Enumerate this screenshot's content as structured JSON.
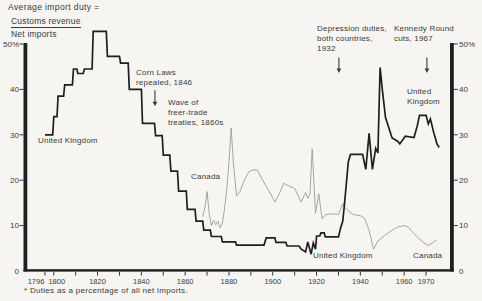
{
  "header": {
    "title": "Average import duty =",
    "numerator": "Customs revenue",
    "denominator": "Net imports"
  },
  "annotations": {
    "corn_laws": {
      "text": "Corn Laws\nrepealed, 1846"
    },
    "wave": {
      "text": "Wave of\nfreer-trade\ntreaties, 1860s"
    },
    "depression": {
      "text": "Depression duties,\nboth countries,\n1932"
    },
    "kennedy": {
      "text": "Kennedy Round\ncuts, 1967"
    }
  },
  "series_labels": {
    "uk_left": "United Kingdom",
    "uk_right": "United\nKingdom",
    "uk_bottom": "United Kingdom",
    "canada_upper": "Canada",
    "canada_lower": "Canada"
  },
  "footnote": "* Duties as a percentage of all net imports.",
  "colors": {
    "uk_line": "#1f1f1f",
    "canada_line": "#9c9c9c",
    "axis": "#1f1f1f",
    "text": "#3a3a3a"
  },
  "chart_data": {
    "type": "line",
    "xlabel": "",
    "ylabel": "Average import duty, %",
    "xlim": [
      1787,
      1982
    ],
    "ylim": [
      0,
      50
    ],
    "grid": false,
    "y_axis": {
      "labels": [
        {
          "value": 50,
          "text": "50%"
        },
        {
          "value": 40,
          "text": "40"
        },
        {
          "value": 30,
          "text": "30"
        },
        {
          "value": 20,
          "text": "20"
        },
        {
          "value": 10,
          "text": "10"
        },
        {
          "value": 0,
          "text": "0"
        }
      ]
    },
    "x_axis": {
      "tick_years": [
        1796,
        1800,
        1810,
        1820,
        1830,
        1840,
        1850,
        1860,
        1870,
        1880,
        1890,
        1900,
        1910,
        1920,
        1930,
        1940,
        1950,
        1960,
        1970
      ],
      "labels": [
        {
          "year": 1796,
          "text": "1796",
          "dx": -9
        },
        {
          "year": 1800,
          "text": "1800",
          "dx": 3
        },
        {
          "year": 1820,
          "text": "1820",
          "dx": 0
        },
        {
          "year": 1840,
          "text": "1840",
          "dx": 0
        },
        {
          "year": 1860,
          "text": "1860",
          "dx": 0
        },
        {
          "year": 1880,
          "text": "1880",
          "dx": 0
        },
        {
          "year": 1900,
          "text": "1900",
          "dx": 0
        },
        {
          "year": 1920,
          "text": "1920",
          "dx": 0
        },
        {
          "year": 1940,
          "text": "1940",
          "dx": 0
        },
        {
          "year": 1960,
          "text": "1960",
          "dx": 0
        },
        {
          "year": 1970,
          "text": "1970",
          "dx": 0
        }
      ]
    },
    "annotation_arrows": [
      {
        "name": "corn-laws-arrow",
        "year": 1846.2,
        "value_from": 39.8,
        "value_to": 36.3
      },
      {
        "name": "depression-arrow",
        "year": 1930.2,
        "value_from": 47.0,
        "value_to": 43.6
      },
      {
        "name": "kennedy-arrow",
        "year": 1970.4,
        "value_from": 47.0,
        "value_to": 43.6
      }
    ],
    "series": [
      {
        "id": "uk",
        "name": "United Kingdom",
        "color": "#1f1f1f",
        "width": 1.7,
        "points": [
          [
            1796,
            30
          ],
          [
            1799.5,
            30
          ],
          [
            1800,
            34
          ],
          [
            1801.5,
            34
          ],
          [
            1802,
            38.5
          ],
          [
            1804.5,
            38.5
          ],
          [
            1805,
            41
          ],
          [
            1808.5,
            41
          ],
          [
            1809,
            44.5
          ],
          [
            1810.5,
            44.5
          ],
          [
            1811,
            43.5
          ],
          [
            1813.5,
            43.5
          ],
          [
            1814,
            44.5
          ],
          [
            1817.5,
            44.5
          ],
          [
            1818,
            52.8
          ],
          [
            1824,
            52.8
          ],
          [
            1824.5,
            47.3
          ],
          [
            1830,
            47.3
          ],
          [
            1830.5,
            45.8
          ],
          [
            1834,
            45.8
          ],
          [
            1834.5,
            40
          ],
          [
            1840,
            40
          ],
          [
            1840.5,
            32.5
          ],
          [
            1846,
            32.5
          ],
          [
            1846.5,
            29.8
          ],
          [
            1849.5,
            29.8
          ],
          [
            1850,
            25.5
          ],
          [
            1853,
            25.5
          ],
          [
            1853.5,
            22
          ],
          [
            1856.5,
            22
          ],
          [
            1857,
            17.6
          ],
          [
            1860.5,
            17.6
          ],
          [
            1861,
            13.6
          ],
          [
            1864.5,
            13.6
          ],
          [
            1865,
            11
          ],
          [
            1868,
            11
          ],
          [
            1868.5,
            9
          ],
          [
            1871.5,
            9
          ],
          [
            1872,
            7.6
          ],
          [
            1876.5,
            7.6
          ],
          [
            1877,
            6.4
          ],
          [
            1883,
            6.4
          ],
          [
            1883.5,
            5.7
          ],
          [
            1896,
            5.7
          ],
          [
            1897,
            7.3
          ],
          [
            1901,
            7.3
          ],
          [
            1901.5,
            6.3
          ],
          [
            1906,
            6.3
          ],
          [
            1906.5,
            5.5
          ],
          [
            1912,
            5.5
          ],
          [
            1913,
            4.8
          ],
          [
            1915,
            4.2
          ],
          [
            1916,
            6.4
          ],
          [
            1917.5,
            3.7
          ],
          [
            1918.5,
            6.2
          ],
          [
            1919.5,
            4.8
          ],
          [
            1920,
            7.7
          ],
          [
            1921.5,
            7.7
          ],
          [
            1922,
            8.4
          ],
          [
            1923.5,
            8.4
          ],
          [
            1924,
            7.5
          ],
          [
            1930,
            7.5
          ],
          [
            1931,
            9.5
          ],
          [
            1932,
            11
          ],
          [
            1933,
            16
          ],
          [
            1934.5,
            24
          ],
          [
            1935.5,
            25.7
          ],
          [
            1941,
            25.7
          ],
          [
            1942.5,
            22.4
          ],
          [
            1944,
            30.3
          ],
          [
            1945.5,
            22.4
          ],
          [
            1947,
            27
          ],
          [
            1948,
            26
          ],
          [
            1949,
            44.8
          ],
          [
            1950,
            40
          ],
          [
            1951.5,
            33.8
          ],
          [
            1954.5,
            29.3
          ],
          [
            1957,
            28.6
          ],
          [
            1958,
            28
          ],
          [
            1960.5,
            29.7
          ],
          [
            1964.5,
            29.4
          ],
          [
            1966,
            32
          ],
          [
            1967,
            34.3
          ],
          [
            1970,
            34.3
          ],
          [
            1971,
            32.4
          ],
          [
            1972,
            33.5
          ],
          [
            1973.5,
            30.5
          ],
          [
            1975,
            28
          ],
          [
            1976,
            27.2
          ]
        ]
      },
      {
        "id": "canada",
        "name": "Canada",
        "color": "#9c9c9c",
        "width": 0.9,
        "points": [
          [
            1868,
            12
          ],
          [
            1869,
            14
          ],
          [
            1870,
            17.5
          ],
          [
            1871,
            12.5
          ],
          [
            1872,
            10
          ],
          [
            1873,
            11.2
          ],
          [
            1874,
            10.2
          ],
          [
            1875,
            11
          ],
          [
            1876,
            9.5
          ],
          [
            1877,
            10.5
          ],
          [
            1878,
            13.8
          ],
          [
            1879,
            18
          ],
          [
            1880,
            24
          ],
          [
            1881,
            31.5
          ],
          [
            1882,
            24
          ],
          [
            1883.5,
            16.5
          ],
          [
            1885,
            17.5
          ],
          [
            1887,
            20
          ],
          [
            1889,
            21.8
          ],
          [
            1891,
            22.3
          ],
          [
            1893,
            22.2
          ],
          [
            1896,
            19.5
          ],
          [
            1899,
            17
          ],
          [
            1901,
            15.2
          ],
          [
            1903,
            17
          ],
          [
            1905,
            19.3
          ],
          [
            1907,
            18.8
          ],
          [
            1910,
            18.2
          ],
          [
            1913,
            15.2
          ],
          [
            1915,
            17.3
          ],
          [
            1916,
            16
          ],
          [
            1917,
            17
          ],
          [
            1918,
            26.9
          ],
          [
            1919.5,
            12.7
          ],
          [
            1921,
            17
          ],
          [
            1922.5,
            11.5
          ],
          [
            1924,
            12.4
          ],
          [
            1927,
            12.6
          ],
          [
            1930,
            12.5
          ],
          [
            1932,
            14.8
          ],
          [
            1933,
            14
          ],
          [
            1935,
            13
          ],
          [
            1937,
            12.4
          ],
          [
            1940,
            12.2
          ],
          [
            1942,
            11.5
          ],
          [
            1944,
            9
          ],
          [
            1946,
            4.8
          ],
          [
            1948,
            6.6
          ],
          [
            1951,
            7.8
          ],
          [
            1954,
            8.8
          ],
          [
            1957,
            9.7
          ],
          [
            1960,
            10
          ],
          [
            1962,
            9.6
          ],
          [
            1964,
            8.5
          ],
          [
            1966,
            7.5
          ],
          [
            1969,
            6.2
          ],
          [
            1971,
            5.6
          ],
          [
            1973,
            6.2
          ],
          [
            1975,
            6.9
          ]
        ]
      }
    ]
  }
}
